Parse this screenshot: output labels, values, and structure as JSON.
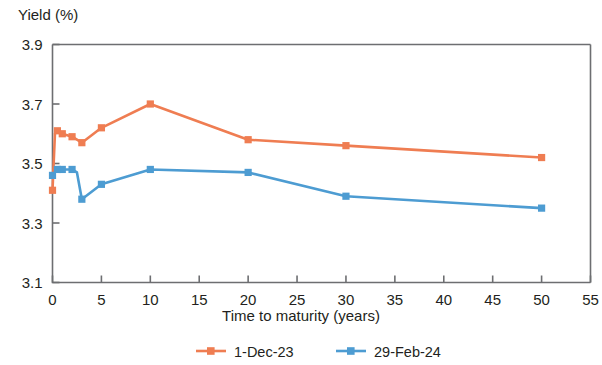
{
  "chart_data": {
    "type": "line",
    "title": "",
    "ylabel": "Yield (%)",
    "xlabel": "Time to maturity (years)",
    "xlim": [
      0,
      55
    ],
    "ylim": [
      3.1,
      3.9
    ],
    "xticks": [
      0,
      5,
      10,
      15,
      20,
      25,
      30,
      35,
      40,
      45,
      50,
      55
    ],
    "xtick_labels": [
      "0",
      "5",
      "10",
      "15",
      "20",
      "25",
      "30",
      "35",
      "40",
      "45",
      "50",
      "55"
    ],
    "yticks": [
      3.1,
      3.3,
      3.5,
      3.7,
      3.9
    ],
    "ytick_labels": [
      "3.1",
      "3.3",
      "3.5",
      "3.7",
      "3.9"
    ],
    "grid": false,
    "legend_position": "bottom",
    "markers": "square",
    "series": [
      {
        "name": "1-Dec-23",
        "color": "#ef7d52",
        "x": [
          0,
          0.25,
          0.5,
          1,
          2,
          2.5,
          3,
          5,
          10,
          20,
          30,
          50
        ],
        "values": [
          3.41,
          3.6,
          3.61,
          3.6,
          3.59,
          3.58,
          3.57,
          3.62,
          3.7,
          3.58,
          3.56,
          3.52
        ]
      },
      {
        "name": "29-Feb-24",
        "color": "#4d9cd2",
        "x": [
          0,
          0.25,
          0.5,
          1,
          2,
          2.5,
          3,
          5,
          10,
          20,
          30,
          50
        ],
        "values": [
          3.46,
          3.47,
          3.48,
          3.48,
          3.48,
          3.47,
          3.38,
          3.43,
          3.48,
          3.47,
          3.39,
          3.35
        ]
      }
    ]
  },
  "legend": {
    "entries": [
      {
        "label": "1-Dec-23",
        "color": "#ef7d52"
      },
      {
        "label": "29-Feb-24",
        "color": "#4d9cd2"
      }
    ]
  },
  "axes": {
    "y_axis_title": "Yield (%)",
    "x_axis_title": "Time to maturity (years)"
  }
}
